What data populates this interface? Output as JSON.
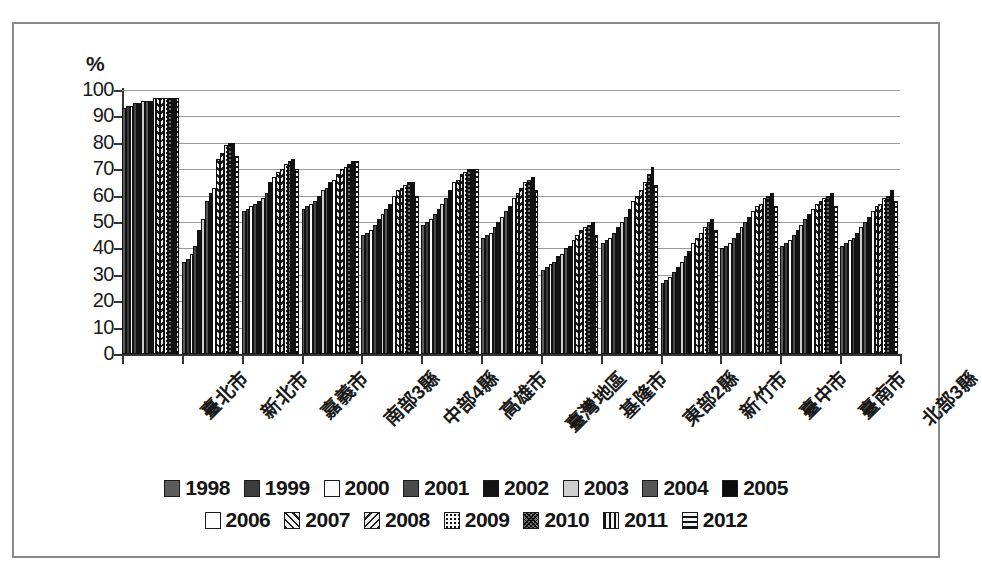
{
  "chart_data": {
    "type": "bar",
    "title": "",
    "xlabel": "",
    "ylabel": "%",
    "ylim": [
      0,
      100
    ],
    "ytick_labels": [
      "100",
      "90",
      "80",
      "70",
      "60",
      "50",
      "40",
      "30",
      "20",
      "10",
      "0"
    ],
    "ytick_values": [
      100,
      90,
      80,
      70,
      60,
      50,
      40,
      30,
      20,
      10,
      0
    ],
    "grid": true,
    "legend_position": "bottom",
    "categories": [
      "臺北市",
      "新北市",
      "嘉義市",
      "南部3縣",
      "中部4縣",
      "高雄市",
      "臺灣地區",
      "基隆市",
      "東部2縣",
      "新竹市",
      "臺中市",
      "臺南市",
      "北部3縣"
    ],
    "series": [
      {
        "name": "1998",
        "pattern": "solid-mid",
        "values": [
          93,
          35,
          54,
          55,
          45,
          49,
          44,
          32,
          42,
          27,
          40,
          41,
          41
        ]
      },
      {
        "name": "1999",
        "pattern": "solid-dark",
        "values": [
          94,
          36,
          55,
          56,
          46,
          50,
          45,
          33,
          43,
          28,
          41,
          42,
          42
        ]
      },
      {
        "name": "2000",
        "pattern": "white",
        "values": [
          94,
          38,
          56,
          57,
          47,
          51,
          46,
          34,
          44,
          29,
          42,
          43,
          43
        ]
      },
      {
        "name": "2001",
        "pattern": "solid-gray",
        "values": [
          95,
          41,
          57,
          58,
          49,
          53,
          48,
          35,
          46,
          31,
          44,
          45,
          44
        ]
      },
      {
        "name": "2002",
        "pattern": "black",
        "values": [
          95,
          47,
          58,
          60,
          51,
          55,
          50,
          37,
          48,
          33,
          46,
          47,
          46
        ]
      },
      {
        "name": "2003",
        "pattern": "light",
        "values": [
          96,
          51,
          59,
          62,
          53,
          57,
          52,
          38,
          50,
          35,
          48,
          49,
          48
        ]
      },
      {
        "name": "2004",
        "pattern": "gray2",
        "values": [
          96,
          58,
          61,
          63,
          55,
          59,
          54,
          40,
          52,
          37,
          50,
          51,
          50
        ]
      },
      {
        "name": "2005",
        "pattern": "black2",
        "values": [
          96,
          61,
          65,
          65,
          57,
          62,
          56,
          41,
          55,
          39,
          52,
          53,
          52
        ]
      },
      {
        "name": "2006",
        "pattern": "white2",
        "values": [
          97,
          63,
          67,
          66,
          60,
          65,
          59,
          43,
          58,
          42,
          54,
          55,
          54
        ]
      },
      {
        "name": "2007",
        "pattern": "diag",
        "values": [
          97,
          74,
          69,
          68,
          62,
          66,
          61,
          45,
          60,
          44,
          56,
          57,
          56
        ]
      },
      {
        "name": "2008",
        "pattern": "diag2",
        "values": [
          97,
          76,
          70,
          70,
          63,
          68,
          63,
          47,
          62,
          46,
          57,
          58,
          57
        ]
      },
      {
        "name": "2009",
        "pattern": "dots",
        "values": [
          97,
          79,
          72,
          71,
          64,
          69,
          65,
          48,
          65,
          48,
          59,
          59,
          59
        ]
      },
      {
        "name": "2010",
        "pattern": "dense",
        "values": [
          97,
          80,
          73,
          72,
          65,
          70,
          66,
          49,
          68,
          50,
          60,
          60,
          60
        ]
      },
      {
        "name": "2011",
        "pattern": "vert",
        "values": [
          97,
          80,
          74,
          73,
          65,
          70,
          67,
          50,
          71,
          51,
          61,
          61,
          62
        ]
      },
      {
        "name": "2012",
        "pattern": "horz",
        "values": [
          97,
          75,
          70,
          73,
          60,
          70,
          62,
          45,
          64,
          47,
          56,
          56,
          58
        ]
      }
    ]
  },
  "legend": {
    "row1": [
      "1998",
      "1999",
      "2000",
      "2001",
      "2002",
      "2003",
      "2004",
      "2005"
    ],
    "row2": [
      "2006",
      "2007",
      "2008",
      "2009",
      "2010",
      "2011",
      "2012"
    ]
  },
  "axis": {
    "y_title": "%"
  },
  "colors": {
    "frame": "#8a8a8a",
    "axis": "#333333",
    "gridline": "#9a9a9a",
    "text": "#1a1a1a",
    "bar_default": "#3a3a3a"
  }
}
